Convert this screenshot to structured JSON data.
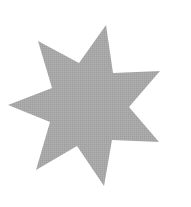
{
  "figure": {
    "shape": "seven-pointed-star",
    "points": 7,
    "fill_color": "#a6a6a6",
    "background_color": "#ffffff",
    "vertices": [
      [
        106,
        25
      ],
      [
        113,
        73
      ],
      [
        160,
        71
      ],
      [
        129,
        107
      ],
      [
        159,
        142
      ],
      [
        112,
        140
      ],
      [
        104,
        186
      ],
      [
        77,
        146
      ],
      [
        36,
        170
      ],
      [
        50,
        122
      ],
      [
        8,
        105
      ],
      [
        52,
        88
      ],
      [
        38,
        41
      ],
      [
        79,
        63
      ]
    ]
  }
}
